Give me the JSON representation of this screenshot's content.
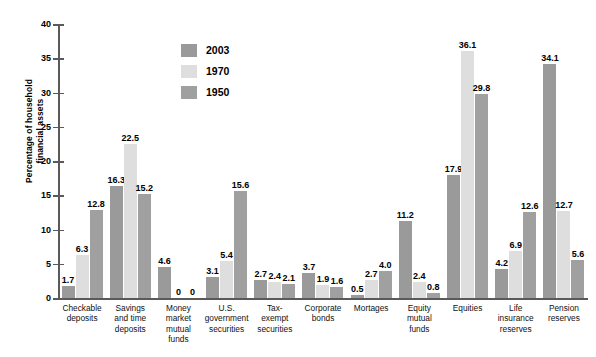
{
  "chart_data": {
    "type": "bar",
    "title": "",
    "xlabel": "",
    "ylabel": "Percentage of household financial assets",
    "ylabel_lines": [
      "Percentage of household",
      "financial assets"
    ],
    "ylim": [
      0,
      40
    ],
    "yticks": [
      0,
      5,
      10,
      15,
      20,
      25,
      30,
      35,
      40
    ],
    "ytick_labels": [
      "0",
      "5",
      "10",
      "15",
      "20",
      "25",
      "30",
      "35",
      "40"
    ],
    "grid": false,
    "legend_position": "top-center-left",
    "categories": [
      "Checkable\ndeposits",
      "Savings\nand time\ndeposits",
      "Money\nmarket\nmutual\nfunds",
      "U.S.\ngovernment\nsecurities",
      "Tax-\nexempt\nsecurities",
      "Corporate\nbonds",
      "Mortages",
      "Equity\nmutual\nfunds",
      "Equities",
      "Life\ninsurance\nreserves",
      "Pension\nreserves"
    ],
    "series": [
      {
        "name": "2003",
        "color": "#9a9a9a",
        "values": [
          1.7,
          16.3,
          4.6,
          3.1,
          2.7,
          3.7,
          0.5,
          11.2,
          17.9,
          4.2,
          34.1
        ],
        "labels": [
          "1.7",
          "16.3",
          "4.6",
          "3.1",
          "2.7",
          "3.7",
          "0.5",
          "11.2",
          "17.9",
          "4.2",
          "34.1"
        ]
      },
      {
        "name": "1970",
        "color": "#dedede",
        "values": [
          6.3,
          22.5,
          0,
          5.4,
          2.4,
          1.9,
          2.7,
          2.4,
          36.1,
          6.9,
          12.7
        ],
        "labels": [
          "6.3",
          "22.5",
          "0",
          "5.4",
          "2.4",
          "1.9",
          "2.7",
          "2.4",
          "36.1",
          "6.9",
          "12.7"
        ]
      },
      {
        "name": "1950",
        "color": "#a0a0a0",
        "values": [
          12.8,
          15.2,
          0,
          15.6,
          2.1,
          1.6,
          4.0,
          0.8,
          29.8,
          12.6,
          5.6
        ],
        "labels": [
          "12.8",
          "15.2",
          "0",
          "15.6",
          "2.1",
          "1.6",
          "4.0",
          "0.8",
          "29.8",
          "12.6",
          "5.6"
        ]
      }
    ]
  },
  "legend": {
    "items": [
      {
        "label": "2003",
        "color": "#9a9a9a"
      },
      {
        "label": "1970",
        "color": "#dedede"
      },
      {
        "label": "1950",
        "color": "#a0a0a0"
      }
    ]
  }
}
